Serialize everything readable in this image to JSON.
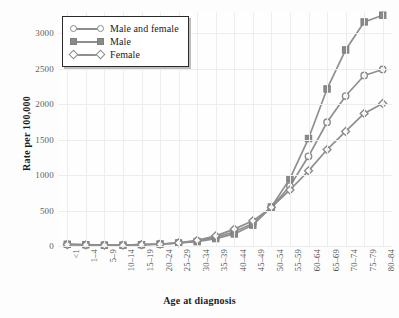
{
  "chart_data": {
    "type": "line",
    "title": "",
    "xlabel": "Age at diagnosis",
    "ylabel": "Rate per 100,000",
    "categories": [
      "<1",
      "1–4",
      "5–9",
      "10–14",
      "15–19",
      "20–24",
      "25–29",
      "30–34",
      "35–39",
      "40–44",
      "45–49",
      "50–54",
      "55–59",
      "60–64",
      "65–69",
      "70–74",
      "75–79",
      "80–84"
    ],
    "yticks": [
      0,
      500,
      1000,
      1500,
      2000,
      2500,
      3000
    ],
    "ylim": [
      0,
      3300
    ],
    "grid": true,
    "legend_position": "top-left",
    "series": [
      {
        "name": "Male and female",
        "marker": "circle-open",
        "values": [
          22,
          16,
          11,
          11,
          18,
          26,
          42,
          70,
          123,
          200,
          318,
          545,
          845,
          1265,
          1745,
          2115,
          2405,
          2490
        ]
      },
      {
        "name": "Male",
        "marker": "square-filled",
        "values": [
          24,
          18,
          12,
          12,
          19,
          28,
          42,
          62,
          105,
          170,
          295,
          550,
          950,
          1515,
          2215,
          2765,
          3160,
          3255
        ]
      },
      {
        "name": "Female",
        "marker": "diamond-open",
        "values": [
          20,
          15,
          11,
          11,
          18,
          25,
          44,
          80,
          143,
          238,
          355,
          545,
          790,
          1060,
          1360,
          1615,
          1870,
          2010
        ]
      }
    ]
  },
  "legend": {
    "items": [
      {
        "label": "Male and female"
      },
      {
        "label": "Male"
      },
      {
        "label": "Female"
      }
    ]
  }
}
